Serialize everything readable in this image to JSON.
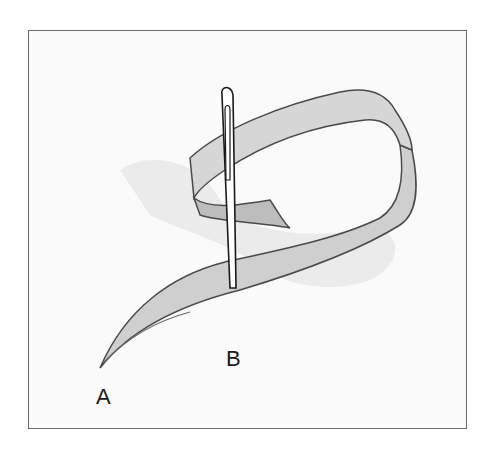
{
  "figure": {
    "labels": {
      "a": "A",
      "b": "B"
    },
    "colors": {
      "ribbon": "#c8c8c8",
      "ribbon_shadow": "#e2e2e2",
      "outline": "#4a4a4a",
      "needle": "#ffffff",
      "frame_border": "#6b6b6b"
    }
  }
}
